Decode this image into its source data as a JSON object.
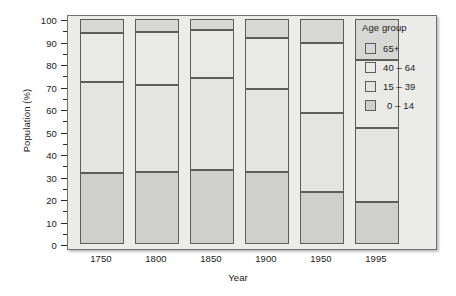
{
  "chart_data": {
    "type": "bar",
    "subtype": "stacked-100-percent",
    "title": "",
    "xlabel": "Year",
    "ylabel": "Population (%)",
    "categories": [
      "1750",
      "1800",
      "1850",
      "1900",
      "1950",
      "1995"
    ],
    "ylim": [
      0,
      100
    ],
    "ytick_step": 10,
    "yminor_step": 5,
    "ytick_labels": [
      "0",
      "10",
      "20",
      "30",
      "40",
      "50",
      "60",
      "70",
      "80",
      "90",
      "100"
    ],
    "grid": false,
    "legend_position": "right",
    "legend_title": "Age group",
    "series": [
      {
        "name": "0 – 14",
        "color": "#cfcfcd",
        "values": [
          31.5,
          32.0,
          32.7,
          31.8,
          23.3,
          18.6
        ]
      },
      {
        "name": "15 – 39",
        "color": "#e4e4e2",
        "values": [
          40.5,
          38.8,
          41.3,
          37.0,
          34.9,
          32.8
        ]
      },
      {
        "name": "40 – 64",
        "color": "#e9e9e7",
        "values": [
          22.0,
          23.5,
          21.0,
          22.7,
          31.1,
          30.2
        ]
      },
      {
        "name": "65+",
        "color": "#d7d7d5",
        "values": [
          6.0,
          5.7,
          5.0,
          8.5,
          10.7,
          18.4
        ]
      }
    ],
    "cumulative_boundaries": {
      "note": "stack top edge of each segment, in percent",
      "1750": {
        "0 – 14": 31.5,
        "15 – 39": 72.0,
        "40 – 64": 94.0,
        "65+": 100
      },
      "1800": {
        "0 – 14": 32.0,
        "15 – 39": 70.8,
        "40 – 64": 94.3,
        "65+": 100
      },
      "1850": {
        "0 – 14": 32.7,
        "15 – 39": 74.0,
        "40 – 64": 95.0,
        "65+": 100
      },
      "1900": {
        "0 – 14": 31.8,
        "15 – 39": 68.8,
        "40 – 64": 91.5,
        "65+": 100
      },
      "1950": {
        "0 – 14": 23.3,
        "15 – 39": 58.2,
        "40 – 64": 89.3,
        "65+": 100
      },
      "1995": {
        "0 – 14": 18.6,
        "15 – 39": 51.4,
        "40 – 64": 81.6,
        "65+": 100
      }
    }
  },
  "legend": {
    "title": "Age group",
    "items": [
      {
        "label": "65+",
        "color": "#d7d7d5"
      },
      {
        "label": "40 – 64",
        "color": "#e9e9e7"
      },
      {
        "label": "15 – 39",
        "color": "#e4e4e2"
      },
      {
        "label": "0 – 14",
        "color": "#cfcfcd"
      }
    ]
  },
  "axes": {
    "y_title": "Population (%)",
    "x_title": "Year"
  },
  "colors": {
    "plot_background": "#ececeb",
    "frame": "#6f6f6f",
    "segment_border": "#5d5d5d",
    "text": "#1a1a1a"
  }
}
